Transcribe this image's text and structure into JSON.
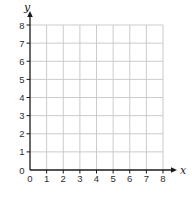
{
  "chart_data": {
    "type": "scatter",
    "title": "",
    "xlabel": "x",
    "ylabel": "y",
    "xlim": [
      0,
      8
    ],
    "ylim": [
      0,
      8
    ],
    "x_ticks": [
      0,
      1,
      2,
      3,
      4,
      5,
      6,
      7,
      8
    ],
    "y_ticks": [
      0,
      1,
      2,
      3,
      4,
      5,
      6,
      7,
      8
    ],
    "grid": true,
    "legend": false,
    "points": []
  },
  "colors": {
    "background": "#ffffff",
    "gridline": "#cbcbcb",
    "axis": "#1a1a1a",
    "tick_text": "#2e2e2e"
  }
}
